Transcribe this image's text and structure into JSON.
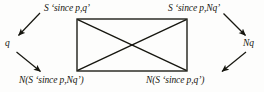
{
  "diagram": {
    "kind": "logic-commutative-diagram",
    "background_color": "#fdfdfc",
    "stroke_color": "#16160f",
    "nodes": {
      "top_left": {
        "id": "S-since-p-q",
        "text": "S ‘since p,q’"
      },
      "top_right": {
        "id": "S-since-p-Nq",
        "text": "S ‘since p,Nq’"
      },
      "left": {
        "id": "q",
        "text": "q"
      },
      "right": {
        "id": "Nq",
        "text": "Nq"
      },
      "bottom_left": {
        "id": "N-S-since-p-Nq",
        "text": "N(S ‘since p,Nq’)"
      },
      "bottom_right": {
        "id": "N-S-since-p-q",
        "text": "N(S ‘since p,q’)"
      }
    },
    "rectangle": {
      "x": 77,
      "y": 19,
      "width": 110,
      "height": 52
    },
    "edges": [
      {
        "id": "rect-top",
        "from": "top_left_corner",
        "to": "top_right_corner",
        "arrow": false
      },
      {
        "id": "rect-right",
        "from": "top_right_corner",
        "to": "bottom_right_corner",
        "arrow": false
      },
      {
        "id": "rect-bottom",
        "from": "bottom_right_corner",
        "to": "bottom_left_corner",
        "arrow": false
      },
      {
        "id": "rect-left",
        "from": "bottom_left_corner",
        "to": "top_left_corner",
        "arrow": false
      },
      {
        "id": "diagonal-tl-br",
        "from": "top_left_corner",
        "to": "bottom_right_corner",
        "arrow": false
      },
      {
        "id": "diagonal-tr-bl",
        "from": "top_right_corner",
        "to": "bottom_left_corner",
        "arrow": false
      },
      {
        "id": "arrow-topleft-to-q",
        "from": "top_left",
        "to": "left",
        "arrow": true
      },
      {
        "id": "arrow-q-to-bottomleft",
        "from": "left",
        "to": "bottom_left",
        "arrow": true
      },
      {
        "id": "arrow-topright-to-Nq",
        "from": "top_right",
        "to": "right",
        "arrow": true
      },
      {
        "id": "arrow-Nq-to-bottomright",
        "from": "right",
        "to": "bottom_right",
        "arrow": true
      }
    ]
  }
}
